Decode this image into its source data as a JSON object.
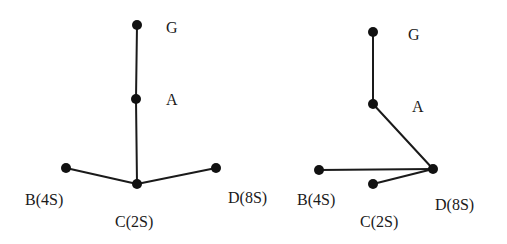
{
  "diagrams": [
    {
      "id": "left",
      "description": "Initial configuration: G–A–C vertical chain with B and D attached to C",
      "nodes": [
        {
          "id": "G",
          "label": "G"
        },
        {
          "id": "A",
          "label": "A"
        },
        {
          "id": "B",
          "label": "B(4S)"
        },
        {
          "id": "C",
          "label": "C(2S)"
        },
        {
          "id": "D",
          "label": "D(8S)"
        }
      ],
      "edges": [
        {
          "from": "G",
          "to": "A"
        },
        {
          "from": "A",
          "to": "C"
        },
        {
          "from": "C",
          "to": "B"
        },
        {
          "from": "C",
          "to": "D"
        }
      ]
    },
    {
      "id": "right",
      "description": "Reconfigured: G–A–D chain with B and C attached to D",
      "nodes": [
        {
          "id": "G",
          "label": "G"
        },
        {
          "id": "A",
          "label": "A"
        },
        {
          "id": "B",
          "label": "B(4S)"
        },
        {
          "id": "C",
          "label": "C(2S)"
        },
        {
          "id": "D",
          "label": "D(8S)"
        }
      ],
      "edges": [
        {
          "from": "G",
          "to": "A"
        },
        {
          "from": "A",
          "to": "D"
        },
        {
          "from": "D",
          "to": "B"
        },
        {
          "from": "D",
          "to": "C"
        }
      ]
    }
  ]
}
